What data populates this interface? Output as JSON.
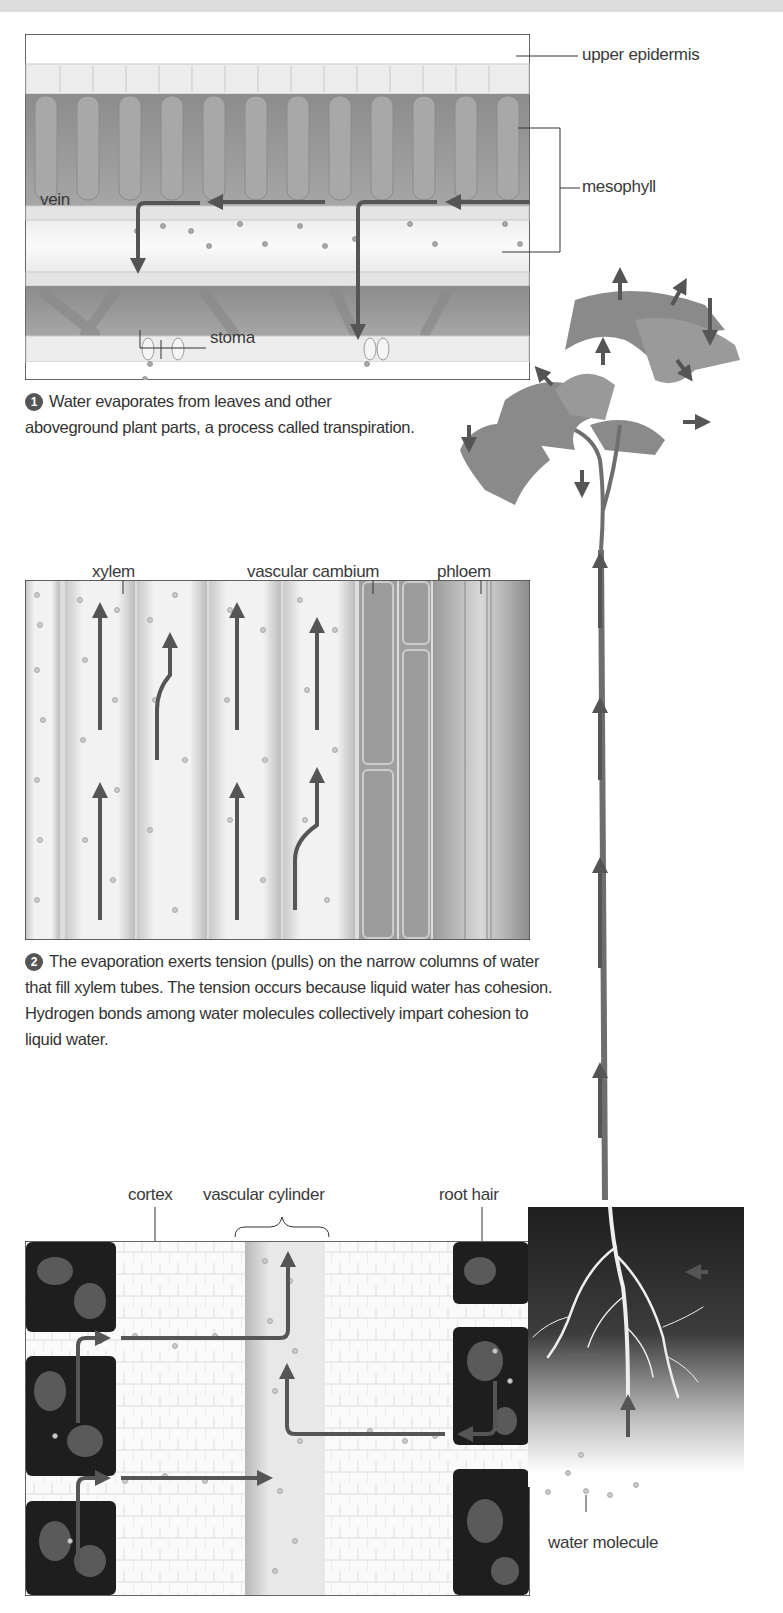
{
  "figure": {
    "panel_leaf": {
      "labels": {
        "upper_epidermis": "upper epidermis",
        "mesophyll": "mesophyll",
        "vein": "vein",
        "stoma": "stoma"
      }
    },
    "step1": {
      "number": "1",
      "text": "Water evaporates from leaves and other aboveground plant parts, a process called transpiration."
    },
    "panel_stem": {
      "labels": {
        "xylem": "xylem",
        "vascular_cambium": "vascular cambium",
        "phloem": "phloem"
      }
    },
    "step2": {
      "number": "2",
      "text": "The evaporation exerts tension (pulls) on the narrow columns of water that fill xylem tubes. The tension occurs because liquid water has cohesion. Hydrogen bonds among water molecules collectively impart cohesion to liquid water."
    },
    "panel_root": {
      "labels": {
        "cortex": "cortex",
        "vascular_cylinder": "vascular cylinder",
        "root_hair": "root hair"
      }
    },
    "panel_soil": {
      "labels": {
        "water_molecule": "water molecule"
      }
    },
    "colors": {
      "arrow": "#555555",
      "leaf": "#8a8a8a",
      "mesophyll": "#9a9a9a",
      "soil": "#1e1e1e",
      "rock": "#5a5a5a",
      "frame": "#333333"
    }
  }
}
